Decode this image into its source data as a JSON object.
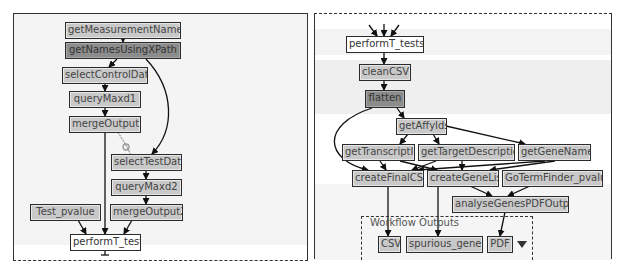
{
  "left_panel": {
    "nodes": {
      "getMeasurementNames": "getMeasurementNames",
      "getNamesUsingXPath": "getNamesUsingXPath",
      "selectControlData": "selectControlData",
      "queryMaxd1": "queryMaxd1",
      "mergeOutput1": "mergeOutput1",
      "selectTestData": "selectTestData",
      "queryMaxd2": "queryMaxd2",
      "Test_pvalue": "Test_pvalue",
      "mergeOutput2": "mergeOutput2",
      "performT_tests": "performT_tests"
    },
    "edges": [
      [
        "getMeasurementNames",
        "getNamesUsingXPath"
      ],
      [
        "getNamesUsingXPath",
        "selectControlData"
      ],
      [
        "getNamesUsingXPath",
        "selectTestData"
      ],
      [
        "selectControlData",
        "queryMaxd1"
      ],
      [
        "queryMaxd1",
        "mergeOutput1"
      ],
      [
        "mergeOutput1",
        "selectTestData"
      ],
      [
        "mergeOutput1",
        "performT_tests"
      ],
      [
        "selectTestData",
        "queryMaxd2"
      ],
      [
        "queryMaxd2",
        "mergeOutput2"
      ],
      [
        "Test_pvalue",
        "performT_tests"
      ],
      [
        "mergeOutput2",
        "performT_tests"
      ]
    ]
  },
  "right_panel": {
    "nodes": {
      "performT_tests": "performT_tests",
      "cleanCSV": "cleanCSV",
      "flatten": "flatten",
      "getAffyIds": "getAffyIds",
      "getTranscriptId": "getTranscriptId",
      "getTargetDescription": "getTargetDescription",
      "getGeneName": "getGeneName",
      "createFinalCSV": "createFinalCSV",
      "createGeneList": "createGeneList",
      "GoTermFinder_pvalue": "GoTermFinder_pvalue",
      "analyseGenesPDFOutput": "analyseGenesPDFOutput"
    },
    "workflow_outputs": {
      "label": "Workflow Outputs",
      "items": [
        "CSV",
        "spurious_genes",
        "PDF"
      ]
    },
    "edges": [
      [
        "performT_tests",
        "cleanCSV"
      ],
      [
        "cleanCSV",
        "flatten"
      ],
      [
        "flatten",
        "getAffyIds"
      ],
      [
        "flatten",
        "createFinalCSV"
      ],
      [
        "getAffyIds",
        "getTranscriptId"
      ],
      [
        "getAffyIds",
        "getTargetDescription"
      ],
      [
        "getAffyIds",
        "getGeneName"
      ],
      [
        "getTranscriptId",
        "createFinalCSV"
      ],
      [
        "getTranscriptId",
        "createGeneList"
      ],
      [
        "getTargetDescription",
        "createFinalCSV"
      ],
      [
        "getTargetDescription",
        "createGeneList"
      ],
      [
        "getGeneName",
        "createFinalCSV"
      ],
      [
        "getGeneName",
        "createGeneList"
      ],
      [
        "createFinalCSV",
        "CSV"
      ],
      [
        "createGeneList",
        "spurious_genes"
      ],
      [
        "createGeneList",
        "analyseGenesPDFOutput"
      ],
      [
        "GoTermFinder_pvalue",
        "analyseGenesPDFOutput"
      ],
      [
        "analyseGenesPDFOutput",
        "PDF"
      ]
    ]
  },
  "colors": {
    "node_fill": "#c9c9c9",
    "node_dark_fill": "#8c8c8c",
    "node_white_fill": "#ffffff",
    "border": "#2b2b2b",
    "panel_bg": "#f4f4f4"
  }
}
